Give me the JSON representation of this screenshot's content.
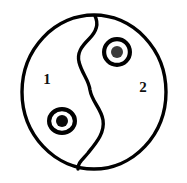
{
  "figure": {
    "type": "diagram",
    "title": "",
    "background_color": "#ffffff",
    "stroke_color": "#000000",
    "fill_color": "#ffffff",
    "canvas": {
      "width": 187,
      "height": 183
    }
  },
  "outer_circle": {
    "name": "outer-boundary-circle",
    "center_x": 94,
    "center_y": 92,
    "radius_x": 72,
    "radius_y": 77,
    "stroke_width": 3.4,
    "fill": "#ffffff",
    "stroke": "#000000"
  },
  "divider": {
    "name": "s-curve-divider",
    "description": "S-shaped curve splitting the circle into region 1 and region 2",
    "top_point_x": 95,
    "top_point_y": 16,
    "bottom_point_x": 78,
    "bottom_point_y": 169,
    "leftmost_x": 78,
    "leftmost_y": 55,
    "rightmost_x": 103,
    "rightmost_y": 122,
    "stroke_width": 3.4,
    "stroke": "#000000",
    "path": "M 95 16 C 99 24 96 32 89 39 C 81 47 77 53 79 62 C 82 74 89 80 90 90 C 92 102 101 108 103 120 C 105 133 96 143 88 153 C 81 161 78 163 78 169"
  },
  "regions": [
    {
      "id": "region-1",
      "label": "1",
      "label_x": 47,
      "label_y": 81,
      "marker_id": "marker-1"
    },
    {
      "id": "region-2",
      "label": "2",
      "label_x": 143,
      "label_y": 89,
      "marker_id": "marker-2"
    }
  ],
  "markers": [
    {
      "id": "marker-1",
      "name": "concentric-circle-marker-lower-left",
      "region": "1",
      "center_x": 62,
      "center_y": 121,
      "outer_radius": 15,
      "outer_radius_y": 14,
      "ring_stroke_width": 4.2,
      "inner_dot_radius": 6,
      "inner_dot_color": "#0a0a0a",
      "ring_color": "#000000",
      "gap_color": "#ffffff"
    },
    {
      "id": "marker-2",
      "name": "concentric-circle-marker-upper-right",
      "region": "2",
      "center_x": 117,
      "center_y": 52,
      "outer_radius": 15,
      "outer_radius_y": 15,
      "ring_stroke_width": 4.2,
      "inner_dot_radius": 6,
      "inner_dot_color": "#3a3a3a",
      "ring_color": "#000000",
      "gap_color": "#ffffff"
    }
  ]
}
